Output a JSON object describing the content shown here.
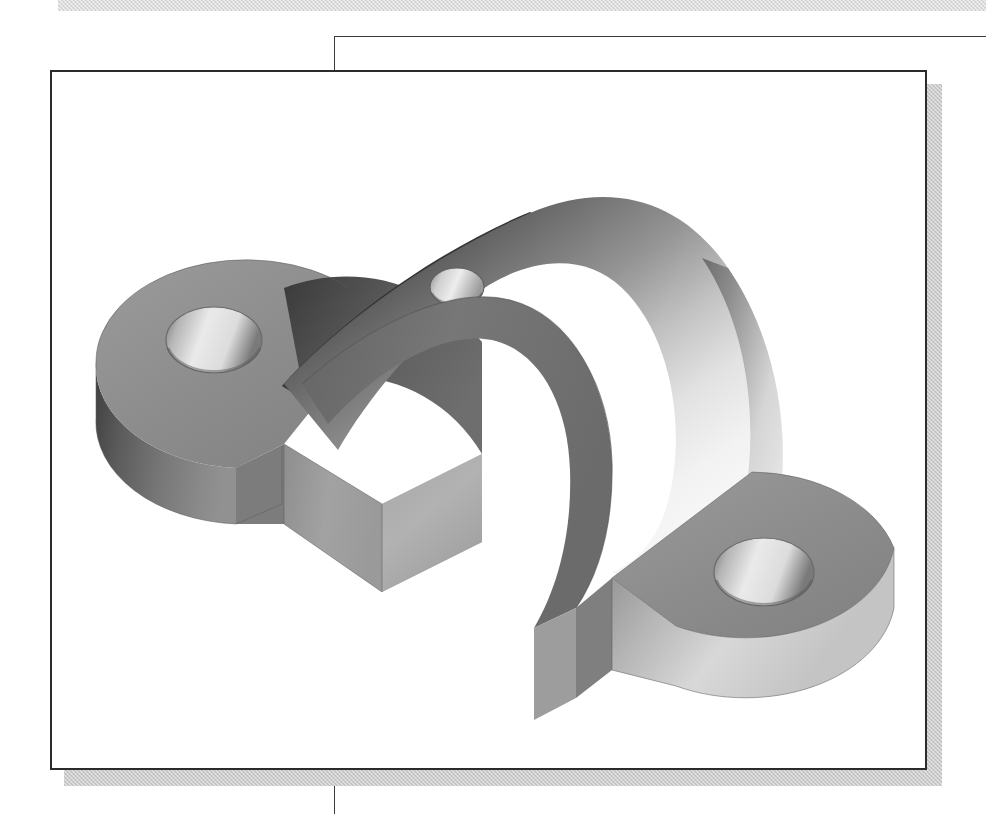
{
  "page": {
    "width": 986,
    "height": 814,
    "background_color": "#ffffff"
  },
  "header_band": {
    "name": "header-rule-band",
    "color": "#d9d9d9",
    "texture": "dithered-halftone"
  },
  "frame": {
    "rule_color": "#3a3a3a",
    "top_rule_y": 36,
    "vertical_rule_x": 334
  },
  "viewport": {
    "title": "CAD Isometric Part View",
    "border_color": "#2b2b2b",
    "background_color": "#ffffff",
    "shadow_color": "#c9c9c9"
  },
  "model": {
    "name": "bearing-saddle-bracket",
    "description": "Isometric shaded solid model of a saddle / pillow-block bracket with two mounting flanges and a central curved arch",
    "render_style": "flat-shaded grayscale isometric",
    "features": [
      {
        "id": "left-flange",
        "label": "Left circular mounting flange",
        "shading": "medium-gray"
      },
      {
        "id": "left-flange-hole",
        "label": "Left counterbored mounting hole",
        "shading": "light-gray-bore"
      },
      {
        "id": "right-flange",
        "label": "Right circular mounting flange",
        "shading": "medium-gray"
      },
      {
        "id": "right-flange-hole",
        "label": "Right counterbored mounting hole",
        "shading": "light-gray-bore"
      },
      {
        "id": "saddle-arch",
        "label": "Central cylindrical saddle with through bore",
        "shading": "gradient-dark-to-light"
      },
      {
        "id": "saddle-top-hole",
        "label": "Small oil / grease hole on saddle crown",
        "shading": "light-gray-bore"
      },
      {
        "id": "arch-opening",
        "label": "Semicircular arch opening under the saddle",
        "shading": "white-void"
      }
    ],
    "palette": {
      "top_face": "#8d8d8d",
      "top_face_light": "#a0a0a0",
      "side_dark": "#4c4c4c",
      "side_mid": "#6e6e6e",
      "side_light": "#c8c8c8",
      "bore_light": "#e8e8e8",
      "bore_dark": "#6a6a6a",
      "crown_highlight": "#f6f6f6",
      "ridge_shadow": "#2c2c2c",
      "outline": "#5a5a5a"
    }
  }
}
